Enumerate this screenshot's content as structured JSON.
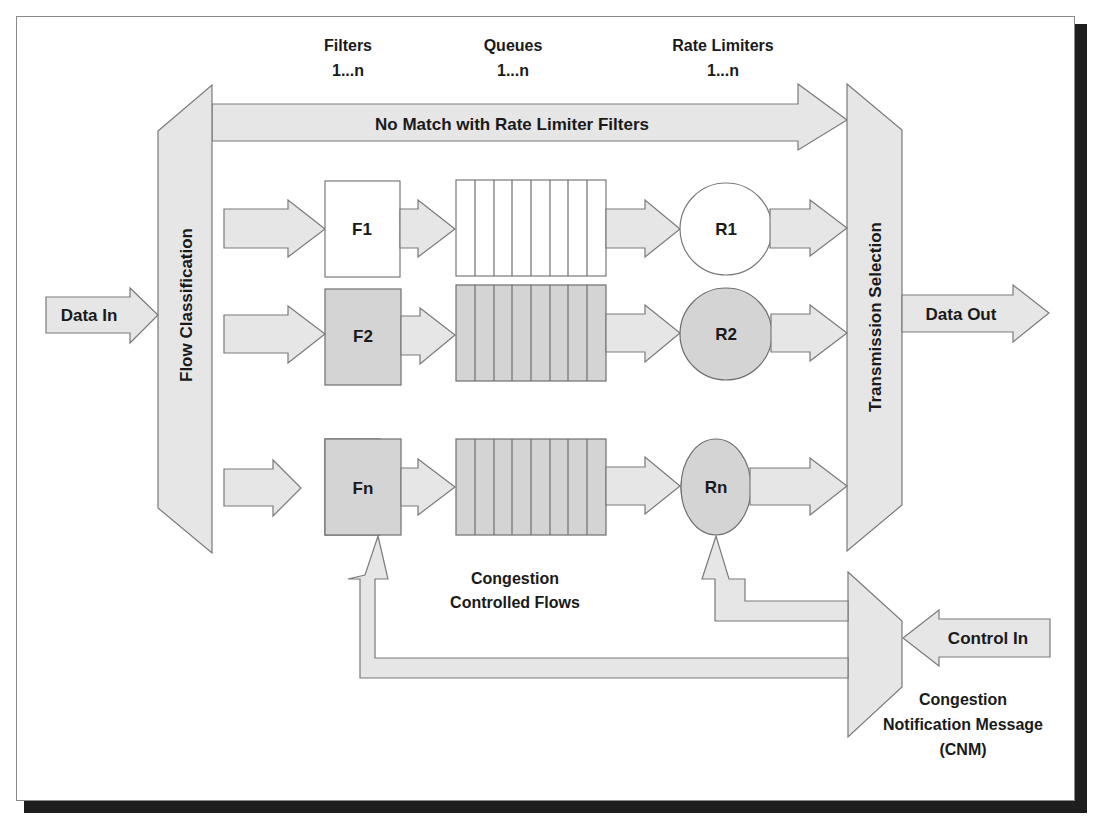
{
  "diagram": {
    "headers": {
      "filters": {
        "line1": "Filters",
        "line2": "1...n"
      },
      "queues": {
        "line1": "Queues",
        "line2": "1...n"
      },
      "rate_limiters": {
        "line1": "Rate Limiters",
        "line2": "1...n"
      }
    },
    "no_match_label": "No Match with Rate Limiter Filters",
    "flow_classification_label": "Flow Classification",
    "transmission_selection_label": "Transmission Selection",
    "data_in_label": "Data In",
    "data_out_label": "Data Out",
    "control_in_label": "Control In",
    "filters": [
      {
        "label": "F1",
        "style": "white"
      },
      {
        "label": "F2",
        "style": "grey"
      },
      {
        "label": "Fn",
        "style": "grey"
      }
    ],
    "rate_limiters": [
      {
        "label": "R1",
        "style": "white"
      },
      {
        "label": "R2",
        "style": "grey"
      },
      {
        "label": "Rn",
        "style": "grey"
      }
    ],
    "queue_slots": 8,
    "congestion_flows_label": {
      "line1": "Congestion",
      "line2": "Controlled Flows"
    },
    "cnm_label": {
      "line1": "Congestion",
      "line2": "Notification Message",
      "line3": "(CNM)"
    },
    "colors": {
      "arrow_fill": "#e6e6e6",
      "grey_fill": "#d4d4d4",
      "white_fill": "#ffffff",
      "stroke": "#7a7a7a",
      "frame_shadow": "#1e1e1e"
    }
  }
}
